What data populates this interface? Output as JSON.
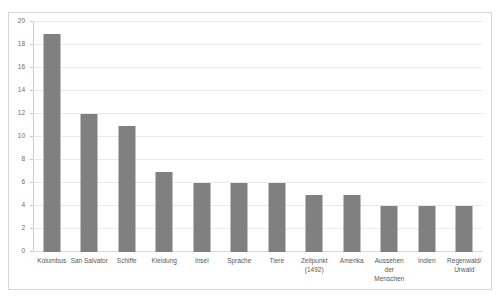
{
  "chart_data": {
    "type": "bar",
    "title": "",
    "xlabel": "",
    "ylabel": "",
    "ylim": [
      0,
      20
    ],
    "ytick_step": 2,
    "yticks": [
      20,
      18,
      16,
      14,
      12,
      10,
      8,
      6,
      4,
      2,
      0
    ],
    "grid": true,
    "legend": "none",
    "bar_color": "#808080",
    "gridline_color": "#e9e9e9",
    "plot_border_color": "#d6d6d6",
    "categories": [
      "Kolumbus",
      "San Salvator",
      "Schiffe",
      "Kleidung",
      "Insel",
      "Sprache",
      "Tiere",
      "Zeitpunkt\n(1492)",
      "Amerika",
      "Aussehen\nder\nMenschen",
      "Indien",
      "Regenwald/\nUrwald"
    ],
    "values": [
      19,
      12,
      11,
      7,
      6,
      6,
      6,
      5,
      5,
      4,
      4,
      4
    ]
  }
}
